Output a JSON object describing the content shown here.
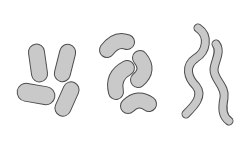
{
  "diagram": {
    "title": "",
    "background": "#ffffff",
    "fill_color": "#c9c9c9",
    "stroke_color": "#4d4d4d",
    "groups": [
      {
        "name": "bacilli",
        "shape": "rod",
        "count": 4,
        "label": ""
      },
      {
        "name": "vibrios",
        "shape": "curved-rod",
        "count": 4,
        "label": ""
      },
      {
        "name": "spirilla",
        "shape": "spiral",
        "count": 2,
        "label": ""
      }
    ]
  }
}
